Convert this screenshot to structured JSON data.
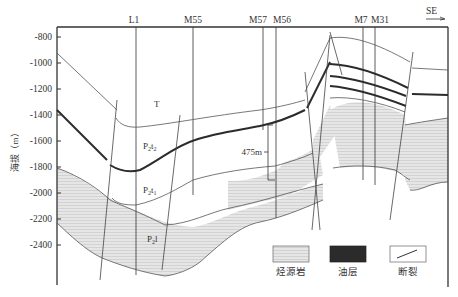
{
  "y_axis": {
    "label": "海拔（m）",
    "ticks": [
      "-800",
      "-1000",
      "-1200",
      "-1400",
      "-1600",
      "-1800",
      "-2000",
      "-2200",
      "-2400"
    ]
  },
  "direction": {
    "label": "SE"
  },
  "wells": [
    {
      "name": "L1"
    },
    {
      "name": "M55"
    },
    {
      "name": "M57"
    },
    {
      "name": "M56"
    },
    {
      "name": "M7"
    },
    {
      "name": "M31"
    }
  ],
  "units": {
    "T": "T",
    "P2t2_base": "P",
    "P2t2_sub": "2",
    "P2t2_rest": "t",
    "P2t2_sub2": "2",
    "P2t1_base": "P",
    "P2t1_sub": "2",
    "P2t1_rest": "t",
    "P2t1_sub2": "1",
    "P2l_base": "P",
    "P2l_sub": "2",
    "P2l_rest": "l"
  },
  "annotation": {
    "thickness": "475m"
  },
  "legend": {
    "items": [
      {
        "label": "烃源岩",
        "type": "hatched"
      },
      {
        "label": "油层",
        "type": "solid"
      },
      {
        "label": "断裂",
        "type": "fault"
      }
    ]
  },
  "colors": {
    "hatch_fill": "#e4e4e4",
    "hatch_line": "#bdbdbd",
    "oil_layer": "#2b2b2b",
    "line": "#444444"
  }
}
